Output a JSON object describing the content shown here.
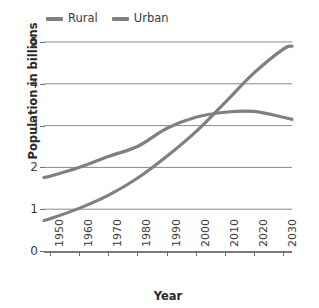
{
  "chart_data": {
    "type": "line",
    "title": "",
    "xlabel": "Year",
    "ylabel": "Population in billions",
    "xlim": [
      1948,
      2033
    ],
    "ylim": [
      0,
      5
    ],
    "grid": true,
    "legend_position": "top-left",
    "x_ticks": [
      1950,
      1960,
      1970,
      1980,
      1990,
      2000,
      2010,
      2020,
      2030
    ],
    "y_ticks": [
      0,
      1,
      2,
      3,
      4,
      5
    ],
    "x": [
      1948,
      1950,
      1960,
      1970,
      1980,
      1990,
      2000,
      2010,
      2020,
      2030,
      2033
    ],
    "series": [
      {
        "name": "Rural",
        "color": "#808080",
        "values": [
          1.76,
          1.79,
          2.0,
          2.26,
          2.5,
          2.93,
          3.2,
          3.32,
          3.34,
          3.2,
          3.15
        ]
      },
      {
        "name": "Urban",
        "color": "#808080",
        "values": [
          0.73,
          0.77,
          1.02,
          1.33,
          1.74,
          2.26,
          2.85,
          3.55,
          4.26,
          4.83,
          4.9
        ]
      }
    ],
    "annotations": [
      {
        "text": "Rural and Urban curves cross near 2008 at about 3.3 billion"
      }
    ]
  },
  "legend": {
    "entries": [
      {
        "label": "Rural",
        "color": "#808080"
      },
      {
        "label": "Urban",
        "color": "#808080"
      }
    ]
  },
  "axes": {
    "y_title": "Population in billions",
    "x_title": "Year",
    "y_tick_labels": [
      "5",
      "4",
      "3",
      "2",
      "1",
      "0"
    ],
    "x_tick_labels": [
      "1950",
      "1960",
      "1970",
      "1980",
      "1990",
      "2000",
      "2010",
      "2020",
      "2030"
    ]
  }
}
